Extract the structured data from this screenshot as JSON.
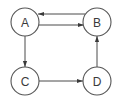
{
  "diagram": {
    "type": "directed-graph",
    "colors": {
      "background": "#ffffff",
      "stroke": "#555555",
      "edge": "#4a4a4a",
      "label": "#3a3a3a"
    },
    "nodes": [
      {
        "id": "A",
        "label": "A",
        "cx": 25,
        "cy": 22,
        "r": 14
      },
      {
        "id": "B",
        "label": "B",
        "cx": 97,
        "cy": 22,
        "r": 14
      },
      {
        "id": "C",
        "label": "C",
        "cx": 25,
        "cy": 81,
        "r": 14
      },
      {
        "id": "D",
        "label": "D",
        "cx": 97,
        "cy": 81,
        "r": 14
      }
    ],
    "edges": [
      {
        "from": "B",
        "to": "A",
        "label": ""
      },
      {
        "from": "A",
        "to": "B",
        "label": ""
      },
      {
        "from": "A",
        "to": "C",
        "label": ""
      },
      {
        "from": "C",
        "to": "D",
        "label": ""
      },
      {
        "from": "D",
        "to": "B",
        "label": ""
      }
    ]
  }
}
